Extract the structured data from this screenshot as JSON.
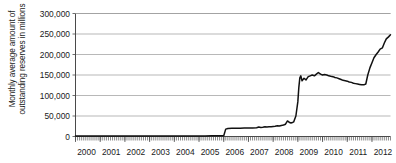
{
  "chart_data": {
    "type": "line",
    "title": "",
    "xlabel": "",
    "ylabel": "Monthly average amount of outstanding reserves in millions",
    "ylim": [
      0,
      300000
    ],
    "yticks": [
      0,
      50000,
      100000,
      150000,
      200000,
      250000,
      300000
    ],
    "ytick_labels": [
      "0",
      "50,000",
      "100,000",
      "150,000",
      "200,000",
      "250,000",
      "300,000"
    ],
    "xlim": [
      2000,
      2012.75
    ],
    "xticks": [
      2000,
      2001,
      2002,
      2003,
      2004,
      2005,
      2006,
      2007,
      2008,
      2009,
      2010,
      2011,
      2012
    ],
    "xtick_labels": [
      "2000",
      "2001",
      "2002",
      "2003",
      "2004",
      "2005",
      "2006",
      "2007",
      "2008",
      "2009",
      "2010",
      "2011",
      "2012"
    ],
    "grid": true,
    "legend": "none",
    "minor_ticks": "monthly",
    "series": [
      {
        "name": "Monthly average outstanding reserves",
        "color": "#111111",
        "x": [
          2000.0,
          2000.25,
          2000.5,
          2000.75,
          2001.0,
          2001.25,
          2001.5,
          2001.75,
          2002.0,
          2002.25,
          2002.5,
          2002.75,
          2003.0,
          2003.25,
          2003.5,
          2003.75,
          2004.0,
          2004.25,
          2004.5,
          2004.75,
          2005.0,
          2005.25,
          2005.5,
          2005.75,
          2005.9,
          2006.0,
          2006.08,
          2006.17,
          2006.33,
          2006.5,
          2006.67,
          2006.83,
          2007.0,
          2007.17,
          2007.33,
          2007.42,
          2007.5,
          2007.58,
          2007.67,
          2007.75,
          2007.83,
          2007.92,
          2008.0,
          2008.08,
          2008.17,
          2008.25,
          2008.33,
          2008.42,
          2008.5,
          2008.58,
          2008.67,
          2008.72,
          2008.78,
          2008.83,
          2008.92,
          2009.0,
          2009.04,
          2009.08,
          2009.12,
          2009.17,
          2009.25,
          2009.33,
          2009.42,
          2009.5,
          2009.58,
          2009.67,
          2009.75,
          2009.83,
          2009.92,
          2010.0,
          2010.08,
          2010.17,
          2010.25,
          2010.33,
          2010.42,
          2010.5,
          2010.58,
          2010.67,
          2010.75,
          2010.83,
          2010.92,
          2011.0,
          2011.08,
          2011.17,
          2011.25,
          2011.33,
          2011.42,
          2011.5,
          2011.58,
          2011.67,
          2011.75,
          2011.83,
          2011.92,
          2012.0,
          2012.08,
          2012.17,
          2012.25,
          2012.33,
          2012.42,
          2012.5,
          2012.58,
          2012.67,
          2012.75
        ],
        "y": [
          1200,
          1200,
          1300,
          1300,
          1300,
          1200,
          1300,
          1300,
          1300,
          1300,
          1400,
          1300,
          1300,
          1400,
          1400,
          1300,
          1400,
          1400,
          1500,
          1400,
          1500,
          1500,
          1600,
          1700,
          1800,
          2000,
          18000,
          19500,
          20000,
          20200,
          20000,
          20500,
          20500,
          20800,
          21500,
          23000,
          22000,
          22500,
          23500,
          23000,
          23500,
          24000,
          24500,
          25000,
          26000,
          25500,
          27000,
          28000,
          30000,
          38000,
          34000,
          33000,
          34000,
          35500,
          50000,
          85000,
          120000,
          143000,
          148000,
          136000,
          142000,
          138000,
          146000,
          148000,
          150000,
          148000,
          152000,
          156000,
          152000,
          150000,
          151000,
          150000,
          148000,
          147000,
          146000,
          144000,
          143000,
          141000,
          139000,
          137000,
          136000,
          135000,
          133000,
          132000,
          130000,
          129000,
          128000,
          127000,
          126000,
          126000,
          128000,
          150000,
          168000,
          180000,
          192000,
          200000,
          206000,
          213000,
          216000,
          228000,
          238000,
          243000,
          248000
        ]
      }
    ]
  }
}
